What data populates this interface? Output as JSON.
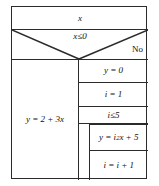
{
  "diagram": {
    "type": "nassi-shneiderman-structogram",
    "title": "",
    "border_color": "#2b2b2b",
    "background": "#ffffff"
  },
  "blocks": {
    "input": {
      "label": "x",
      "kind": "input-statement"
    },
    "condition": {
      "label": "x≤0",
      "kind": "branch-condition",
      "true_label": "",
      "false_label": "No"
    },
    "true_branch": {
      "statement": "y = 2 + 3x",
      "kind": "assignment"
    },
    "false_branch": {
      "statements": [
        {
          "text": "y = 0",
          "kind": "assignment"
        },
        {
          "text": "i = 1",
          "kind": "assignment"
        }
      ],
      "loop": {
        "condition": "i≤5",
        "kind": "while-loop",
        "body": [
          {
            "text_prefix": "y = i",
            "text_sup": "2",
            "text_suffix": "x + 5",
            "text": "y = i²x + 5",
            "kind": "assignment"
          },
          {
            "text": "i = i + 1",
            "kind": "assignment"
          }
        ]
      }
    }
  }
}
